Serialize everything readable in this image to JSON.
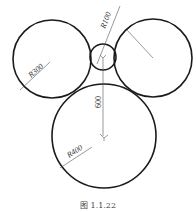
{
  "figure": {
    "caption": "图 1.1.22",
    "circles": [
      {
        "name": "left-circle",
        "label": "R300",
        "cx": 52,
        "cy": 59,
        "r": 39
      },
      {
        "name": "small-circle",
        "label": "R100",
        "cx": 103,
        "cy": 57,
        "r": 13
      },
      {
        "name": "right-circle",
        "label": "",
        "cx": 153,
        "cy": 58,
        "r": 39
      },
      {
        "name": "big-circle",
        "label": "R400",
        "cx": 104,
        "cy": 136,
        "r": 52
      }
    ],
    "dimensions": {
      "left_radius": "R300",
      "small_radius": "R100",
      "big_radius": "R400",
      "vertical_distance": "600"
    }
  }
}
